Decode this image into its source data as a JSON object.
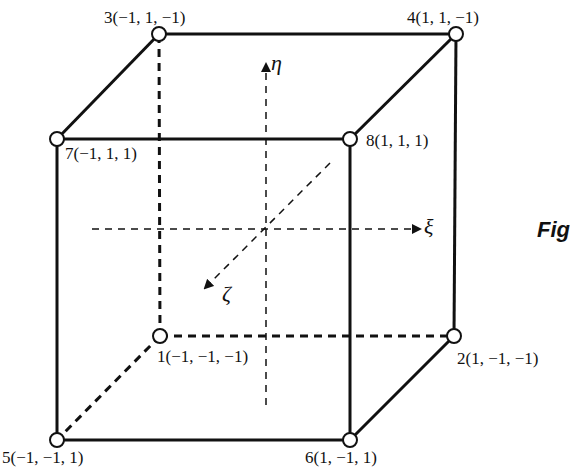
{
  "figure": {
    "caption_partial": "Fig",
    "axes": {
      "xi": "ξ",
      "eta": "η",
      "zeta": "ζ"
    },
    "nodes": [
      {
        "id": 1,
        "label": "1(−1, −1, −1)"
      },
      {
        "id": 2,
        "label": "2(1, −1, −1)"
      },
      {
        "id": 3,
        "label": "3(−1, 1, −1)"
      },
      {
        "id": 4,
        "label": "4(1, 1, −1)"
      },
      {
        "id": 5,
        "label": "5(−1, −1, 1)"
      },
      {
        "id": 6,
        "label": "6(1, −1, 1)"
      },
      {
        "id": 7,
        "label": "7(−1, 1, 1)"
      },
      {
        "id": 8,
        "label": "8(1, 1, 1)"
      }
    ],
    "colors": {
      "line": "#111111",
      "background": "#ffffff"
    }
  }
}
